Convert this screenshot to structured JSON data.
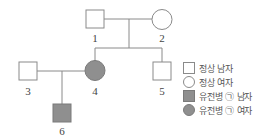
{
  "pedigree": {
    "colors": {
      "line": "#8a8a8a",
      "affected_fill": "#8f8f8f",
      "normal_fill": "#ffffff"
    },
    "individuals": [
      {
        "id": "1",
        "label": "1",
        "sex": "male",
        "affected": false
      },
      {
        "id": "2",
        "label": "2",
        "sex": "female",
        "affected": false
      },
      {
        "id": "3",
        "label": "3",
        "sex": "male",
        "affected": false
      },
      {
        "id": "4",
        "label": "4",
        "sex": "female",
        "affected": true
      },
      {
        "id": "5",
        "label": "5",
        "sex": "male",
        "affected": false
      },
      {
        "id": "6",
        "label": "6",
        "sex": "male",
        "affected": true
      }
    ],
    "relationships": [
      {
        "type": "marriage",
        "between": [
          "1",
          "2"
        ],
        "children": [
          "4",
          "5"
        ]
      },
      {
        "type": "marriage",
        "between": [
          "3",
          "4"
        ],
        "children": [
          "6"
        ]
      }
    ]
  },
  "legend": {
    "items": [
      {
        "icon": "square-empty-icon",
        "label": "정상 남자"
      },
      {
        "icon": "circle-empty-icon",
        "label": "정상 여자"
      },
      {
        "icon": "square-filled-icon",
        "label": "유전병 ㉠ 남자"
      },
      {
        "icon": "circle-filled-icon",
        "label": "유전병 ㉠ 여자"
      }
    ]
  }
}
